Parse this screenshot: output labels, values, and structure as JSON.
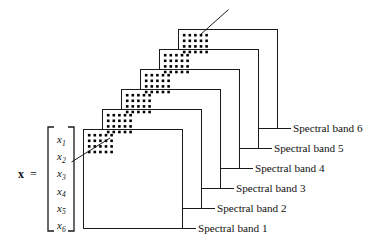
{
  "figure": {
    "background_color": "#ffffff",
    "line_color": "#1a1a1a",
    "dot_color": "#000000"
  },
  "vector": {
    "symbol": "x",
    "equals": "=",
    "components": [
      {
        "base": "x",
        "sub": "1"
      },
      {
        "base": "x",
        "sub": "2"
      },
      {
        "base": "x",
        "sub": "3"
      },
      {
        "base": "x",
        "sub": "4"
      },
      {
        "base": "x",
        "sub": "5"
      },
      {
        "base": "x",
        "sub": "6"
      }
    ]
  },
  "bands": [
    {
      "label": "Spectral band 1"
    },
    {
      "label": "Spectral band 2"
    },
    {
      "label": "Spectral band 3"
    },
    {
      "label": "Spectral band 4"
    },
    {
      "label": "Spectral band 5"
    },
    {
      "label": "Spectral band 6"
    }
  ],
  "pixel_grid": {
    "columns": 5,
    "rows": 4,
    "dot_size_px": 2.6
  },
  "leader_lines": {
    "count": 2,
    "description": "diagonal pointer through pixel grids"
  }
}
